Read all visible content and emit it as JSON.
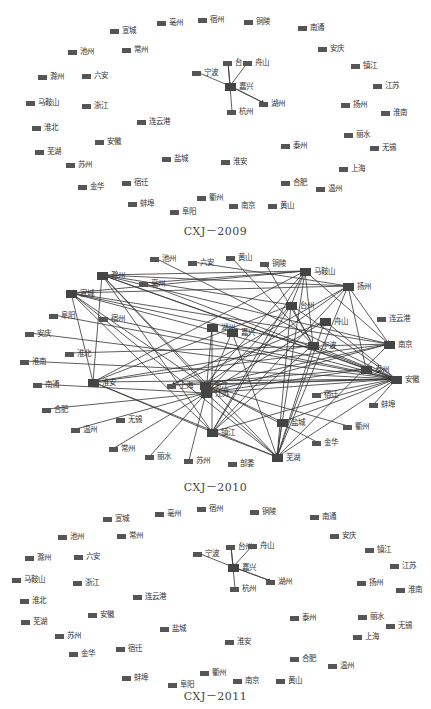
{
  "panels": [
    {
      "caption": "CXJ－2009",
      "top": 0,
      "height": 235,
      "caption_y": 222,
      "nodes": [
        {
          "id": "亳州",
          "x": 157,
          "y": 19
        },
        {
          "id": "宿州",
          "x": 198,
          "y": 16
        },
        {
          "id": "铜陵",
          "x": 244,
          "y": 18
        },
        {
          "id": "南通",
          "x": 298,
          "y": 24
        },
        {
          "id": "宣城",
          "x": 110,
          "y": 27
        },
        {
          "id": "池州",
          "x": 68,
          "y": 48
        },
        {
          "id": "常州",
          "x": 122,
          "y": 46
        },
        {
          "id": "安庆",
          "x": 318,
          "y": 45
        },
        {
          "id": "镇江",
          "x": 351,
          "y": 62
        },
        {
          "id": "滁州",
          "x": 38,
          "y": 73
        },
        {
          "id": "六安",
          "x": 82,
          "y": 72
        },
        {
          "id": "台州",
          "x": 223,
          "y": 59,
          "label": "台"
        },
        {
          "id": "舟山",
          "x": 243,
          "y": 59
        },
        {
          "id": "宁波",
          "x": 192,
          "y": 69
        },
        {
          "id": "嘉兴",
          "x": 225,
          "y": 83,
          "big": true
        },
        {
          "id": "江苏",
          "x": 373,
          "y": 82
        },
        {
          "id": "马鞍山",
          "x": 26,
          "y": 99
        },
        {
          "id": "浙江",
          "x": 82,
          "y": 102
        },
        {
          "id": "湖州",
          "x": 259,
          "y": 100
        },
        {
          "id": "扬州",
          "x": 341,
          "y": 101
        },
        {
          "id": "淮南",
          "x": 381,
          "y": 109
        },
        {
          "id": "杭州",
          "x": 227,
          "y": 108
        },
        {
          "id": "连云港",
          "x": 137,
          "y": 118
        },
        {
          "id": "淮北",
          "x": 32,
          "y": 124
        },
        {
          "id": "丽水",
          "x": 344,
          "y": 131
        },
        {
          "id": "安徽",
          "x": 95,
          "y": 138
        },
        {
          "id": "无锡",
          "x": 370,
          "y": 144
        },
        {
          "id": "泰州",
          "x": 281,
          "y": 142
        },
        {
          "id": "芜湖",
          "x": 35,
          "y": 148
        },
        {
          "id": "盐城",
          "x": 162,
          "y": 155
        },
        {
          "id": "淮安",
          "x": 221,
          "y": 158
        },
        {
          "id": "苏州",
          "x": 66,
          "y": 161
        },
        {
          "id": "上海",
          "x": 339,
          "y": 165
        },
        {
          "id": "宿迁",
          "x": 122,
          "y": 179
        },
        {
          "id": "合肥",
          "x": 281,
          "y": 179
        },
        {
          "id": "金华",
          "x": 78,
          "y": 183
        },
        {
          "id": "温州",
          "x": 316,
          "y": 185
        },
        {
          "id": "衢州",
          "x": 197,
          "y": 194
        },
        {
          "id": "蚌埠",
          "x": 128,
          "y": 200
        },
        {
          "id": "南京",
          "x": 229,
          "y": 202
        },
        {
          "id": "黄山",
          "x": 268,
          "y": 202
        },
        {
          "id": "阜阳",
          "x": 170,
          "y": 208
        }
      ],
      "edges": [
        [
          "宁波",
          "嘉兴"
        ],
        [
          "台州",
          "嘉兴"
        ],
        [
          "舟山",
          "嘉兴"
        ],
        [
          "湖州",
          "嘉兴"
        ],
        [
          "杭州",
          "嘉兴"
        ],
        [
          "嘉兴",
          "台州"
        ],
        [
          "嘉兴",
          "湖州"
        ]
      ]
    },
    {
      "caption": "CXJ－2010",
      "top": 240,
      "height": 250,
      "caption_y": 238,
      "nodes": [
        {
          "id": "池州",
          "x": 150,
          "y": 15
        },
        {
          "id": "六安",
          "x": 188,
          "y": 19
        },
        {
          "id": "黄山",
          "x": 226,
          "y": 14
        },
        {
          "id": "铜陵",
          "x": 260,
          "y": 20
        },
        {
          "id": "马鞍山",
          "x": 300,
          "y": 28,
          "big": true
        },
        {
          "id": "滁州",
          "x": 97,
          "y": 32,
          "big": true,
          "label": "滁州"
        },
        {
          "id": "亳州",
          "x": 139,
          "y": 40
        },
        {
          "id": "扬州",
          "x": 343,
          "y": 43,
          "big": true
        },
        {
          "id": "宣城",
          "x": 66,
          "y": 50,
          "big": true
        },
        {
          "id": "台州",
          "x": 286,
          "y": 62,
          "big": true
        },
        {
          "id": "阜阳",
          "x": 49,
          "y": 72
        },
        {
          "id": "宿州",
          "x": 99,
          "y": 75
        },
        {
          "id": "连云港",
          "x": 377,
          "y": 75
        },
        {
          "id": "舟山",
          "x": 320,
          "y": 78,
          "big": true
        },
        {
          "id": "安庆",
          "x": 25,
          "y": 90
        },
        {
          "id": "湖州",
          "x": 207,
          "y": 84,
          "big": true
        },
        {
          "id": "嘉兴",
          "x": 227,
          "y": 89,
          "big": true
        },
        {
          "id": "宁波",
          "x": 308,
          "y": 102,
          "big": true
        },
        {
          "id": "南京",
          "x": 384,
          "y": 101,
          "big": true
        },
        {
          "id": "淮北",
          "x": 65,
          "y": 110
        },
        {
          "id": "淮南",
          "x": 20,
          "y": 118
        },
        {
          "id": "泰州",
          "x": 361,
          "y": 126,
          "big": true
        },
        {
          "id": "安徽",
          "x": 391,
          "y": 136,
          "big": true
        },
        {
          "id": "南通",
          "x": 33,
          "y": 141
        },
        {
          "id": "淮安",
          "x": 88,
          "y": 139,
          "big": true
        },
        {
          "id": "上海",
          "x": 167,
          "y": 142
        },
        {
          "id": "浙江",
          "x": 200,
          "y": 142,
          "big": true
        },
        {
          "id": "江苏",
          "x": 201,
          "y": 150,
          "big": true
        },
        {
          "id": "宿迁",
          "x": 312,
          "y": 151
        },
        {
          "id": "合肥",
          "x": 42,
          "y": 166
        },
        {
          "id": "蚌埠",
          "x": 369,
          "y": 161
        },
        {
          "id": "无锡",
          "x": 116,
          "y": 176
        },
        {
          "id": "温州",
          "x": 71,
          "y": 186
        },
        {
          "id": "盐城",
          "x": 277,
          "y": 179,
          "big": true
        },
        {
          "id": "衢州",
          "x": 343,
          "y": 183
        },
        {
          "id": "镇江",
          "x": 207,
          "y": 189,
          "big": true
        },
        {
          "id": "金华",
          "x": 312,
          "y": 199
        },
        {
          "id": "常州",
          "x": 109,
          "y": 205
        },
        {
          "id": "丽水",
          "x": 145,
          "y": 213
        },
        {
          "id": "苏州",
          "x": 184,
          "y": 217
        },
        {
          "id": "芜湖",
          "x": 272,
          "y": 214,
          "big": true
        },
        {
          "id": "邵委",
          "x": 228,
          "y": 220,
          "label": "部委"
        }
      ],
      "edges": [
        [
          "滁州",
          "马鞍山"
        ],
        [
          "滁州",
          "扬州"
        ],
        [
          "滁州",
          "台州"
        ],
        [
          "滁州",
          "安徽"
        ],
        [
          "滁州",
          "南京"
        ],
        [
          "滁州",
          "浙江"
        ],
        [
          "滁州",
          "镇江"
        ],
        [
          "滁州",
          "芜湖"
        ],
        [
          "滁州",
          "淮安"
        ],
        [
          "滁州",
          "泰州"
        ],
        [
          "宣城",
          "马鞍山"
        ],
        [
          "宣城",
          "扬州"
        ],
        [
          "宣城",
          "安徽"
        ],
        [
          "宣城",
          "南京"
        ],
        [
          "宣城",
          "浙江"
        ],
        [
          "宣城",
          "淮安"
        ],
        [
          "宣城",
          "镇江"
        ],
        [
          "宣城",
          "芜湖"
        ],
        [
          "宣城",
          "宁波"
        ],
        [
          "亳州",
          "马鞍山"
        ],
        [
          "亳州",
          "安徽"
        ],
        [
          "池州",
          "安徽"
        ],
        [
          "六安",
          "扬州"
        ],
        [
          "黄山",
          "宁波"
        ],
        [
          "铜陵",
          "宁波"
        ],
        [
          "阜阳",
          "安徽"
        ],
        [
          "宿州",
          "安徽"
        ],
        [
          "安庆",
          "安徽"
        ],
        [
          "淮北",
          "南京"
        ],
        [
          "淮南",
          "安徽"
        ],
        [
          "南通",
          "江苏"
        ],
        [
          "合肥",
          "江苏"
        ],
        [
          "温州",
          "江苏"
        ],
        [
          "常州",
          "江苏"
        ],
        [
          "丽水",
          "江苏"
        ],
        [
          "苏州",
          "江苏"
        ],
        [
          "宿迁",
          "安徽"
        ],
        [
          "蚌埠",
          "安徽"
        ],
        [
          "衢州",
          "浙江"
        ],
        [
          "金华",
          "浙江"
        ],
        [
          "马鞍山",
          "台州"
        ],
        [
          "马鞍山",
          "南京"
        ],
        [
          "马鞍山",
          "浙江"
        ],
        [
          "马鞍山",
          "镇江"
        ],
        [
          "马鞍山",
          "芜湖"
        ],
        [
          "马鞍山",
          "淮安"
        ],
        [
          "马鞍山",
          "宁波"
        ],
        [
          "扬州",
          "南京"
        ],
        [
          "扬州",
          "浙江"
        ],
        [
          "扬州",
          "泰州"
        ],
        [
          "扬州",
          "上海"
        ],
        [
          "扬州",
          "镇江"
        ],
        [
          "扬州",
          "芜湖"
        ],
        [
          "台州",
          "安徽"
        ],
        [
          "台州",
          "镇江"
        ],
        [
          "台州",
          "芜湖"
        ],
        [
          "台州",
          "宁波"
        ],
        [
          "台州",
          "江苏"
        ],
        [
          "台州",
          "淮安"
        ],
        [
          "舟山",
          "安徽"
        ],
        [
          "舟山",
          "江苏"
        ],
        [
          "舟山",
          "芜湖"
        ],
        [
          "舟山",
          "上海"
        ],
        [
          "湖州",
          "镇江"
        ],
        [
          "湖州",
          "江苏"
        ],
        [
          "嘉兴",
          "江苏"
        ],
        [
          "嘉兴",
          "芜湖"
        ],
        [
          "宁波",
          "安徽"
        ],
        [
          "宁波",
          "芜湖"
        ],
        [
          "宁波",
          "镇江"
        ],
        [
          "宁波",
          "淮安"
        ],
        [
          "南京",
          "芜湖"
        ],
        [
          "南京",
          "江苏"
        ],
        [
          "南京",
          "淮安"
        ],
        [
          "淮安",
          "安徽"
        ],
        [
          "淮安",
          "镇江"
        ],
        [
          "淮安",
          "芜湖"
        ],
        [
          "上海",
          "安徽"
        ],
        [
          "浙江",
          "安徽"
        ],
        [
          "浙江",
          "南京"
        ],
        [
          "江苏",
          "安徽"
        ],
        [
          "江苏",
          "泰州"
        ],
        [
          "江苏",
          "芜湖"
        ],
        [
          "镇江",
          "安徽"
        ],
        [
          "镇江",
          "芜湖"
        ],
        [
          "盐城",
          "安徽"
        ],
        [
          "盐城",
          "芜湖"
        ],
        [
          "盐城",
          "浙江"
        ],
        [
          "芜湖",
          "安徽"
        ],
        [
          "泰州",
          "上海"
        ]
      ]
    },
    {
      "caption": "CXJ－2011",
      "top": 490,
      "height": 219,
      "caption_y": 197,
      "nodes": [
        {
          "id": "亳州",
          "x": 155,
          "y": 20
        },
        {
          "id": "宿州",
          "x": 197,
          "y": 15
        },
        {
          "id": "铜陵",
          "x": 250,
          "y": 18
        },
        {
          "id": "南通",
          "x": 310,
          "y": 23
        },
        {
          "id": "宣城",
          "x": 103,
          "y": 25
        },
        {
          "id": "池州",
          "x": 58,
          "y": 43
        },
        {
          "id": "常州",
          "x": 117,
          "y": 42
        },
        {
          "id": "安庆",
          "x": 330,
          "y": 42
        },
        {
          "id": "镇江",
          "x": 365,
          "y": 56
        },
        {
          "id": "滁州",
          "x": 25,
          "y": 64
        },
        {
          "id": "六安",
          "x": 74,
          "y": 63
        },
        {
          "id": "台州",
          "x": 226,
          "y": 53
        },
        {
          "id": "舟山",
          "x": 248,
          "y": 52
        },
        {
          "id": "宁波",
          "x": 193,
          "y": 60
        },
        {
          "id": "嘉兴",
          "x": 228,
          "y": 74,
          "big": true
        },
        {
          "id": "江苏",
          "x": 390,
          "y": 72
        },
        {
          "id": "马鞍山",
          "x": 12,
          "y": 86
        },
        {
          "id": "浙江",
          "x": 73,
          "y": 89
        },
        {
          "id": "湖州",
          "x": 266,
          "y": 88
        },
        {
          "id": "扬州",
          "x": 357,
          "y": 89
        },
        {
          "id": "淮南",
          "x": 396,
          "y": 96
        },
        {
          "id": "杭州",
          "x": 230,
          "y": 95
        },
        {
          "id": "连云港",
          "x": 133,
          "y": 103
        },
        {
          "id": "淮北",
          "x": 20,
          "y": 107
        },
        {
          "id": "丽水",
          "x": 358,
          "y": 123
        },
        {
          "id": "安徽",
          "x": 88,
          "y": 121
        },
        {
          "id": "泰州",
          "x": 290,
          "y": 124
        },
        {
          "id": "无锡",
          "x": 386,
          "y": 132
        },
        {
          "id": "芜湖",
          "x": 21,
          "y": 128
        },
        {
          "id": "盐城",
          "x": 160,
          "y": 135
        },
        {
          "id": "淮安",
          "x": 225,
          "y": 148
        },
        {
          "id": "苏州",
          "x": 55,
          "y": 142
        },
        {
          "id": "上海",
          "x": 353,
          "y": 143
        },
        {
          "id": "宿迁",
          "x": 116,
          "y": 155
        },
        {
          "id": "合肥",
          "x": 290,
          "y": 165
        },
        {
          "id": "金华",
          "x": 69,
          "y": 160
        },
        {
          "id": "温州",
          "x": 328,
          "y": 172
        },
        {
          "id": "衢州",
          "x": 200,
          "y": 179
        },
        {
          "id": "蚌埠",
          "x": 122,
          "y": 184
        },
        {
          "id": "南京",
          "x": 233,
          "y": 187
        },
        {
          "id": "黄山",
          "x": 276,
          "y": 187
        },
        {
          "id": "阜阳",
          "x": 168,
          "y": 191
        }
      ],
      "edges": [
        [
          "宁波",
          "嘉兴"
        ],
        [
          "台州",
          "嘉兴"
        ],
        [
          "舟山",
          "嘉兴"
        ],
        [
          "湖州",
          "嘉兴"
        ],
        [
          "杭州",
          "嘉兴"
        ],
        [
          "嘉兴",
          "台州"
        ],
        [
          "嘉兴",
          "湖州"
        ]
      ]
    }
  ],
  "style": {
    "node_color": "#555555",
    "edge_color": "#333333",
    "text_color": "#333333",
    "caption_color": "#444444",
    "background": "#ffffff"
  }
}
